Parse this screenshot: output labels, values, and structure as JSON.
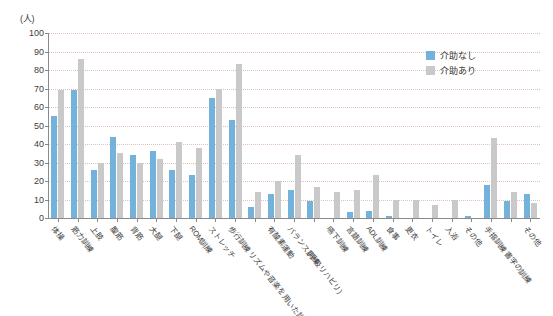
{
  "chart_data": {
    "type": "bar",
    "title": "",
    "subtitle": "",
    "xlabel": "",
    "ylabel": "(人)",
    "ylim": [
      0,
      100
    ],
    "ytick_step": 10,
    "yticks": [
      0,
      10,
      20,
      30,
      40,
      50,
      60,
      70,
      80,
      90,
      100
    ],
    "grid": true,
    "legend_position": "top-right",
    "categories": [
      "体操",
      "筋力訓練",
      "上肢",
      "腹筋",
      "背筋",
      "大腿",
      "下腿",
      "ROM訓練",
      "ストレッチ",
      "歩行訓練",
      "リズムや音楽を用いた訓練",
      "有酸素運動",
      "バランス訓練",
      "(呼吸リハビリ)",
      "嚥下訓練",
      "言語訓練",
      "ADL訓練",
      "食事",
      "更衣",
      "トイレ",
      "入浴",
      "その他",
      "手指訓練",
      "書字の訓練",
      "その他"
    ],
    "category_label_rows": [
      0,
      0,
      0,
      0,
      0,
      0,
      0,
      0,
      0,
      0,
      1,
      0,
      0,
      1,
      0,
      0,
      0,
      0,
      0,
      0,
      0,
      0,
      0,
      1,
      0
    ],
    "series": [
      {
        "name": "介助なし",
        "color": "#73b2da",
        "values": [
          55,
          69,
          26,
          44,
          34,
          36,
          26,
          23,
          65,
          53,
          6,
          13,
          15,
          9,
          0,
          3,
          4,
          1,
          0,
          0,
          0,
          1,
          18,
          9,
          13
        ]
      },
      {
        "name": "介助あり",
        "color": "#c9c9c9",
        "values": [
          69,
          86,
          30,
          35,
          30,
          32,
          41,
          38,
          70,
          83,
          14,
          20,
          34,
          17,
          14,
          15,
          23,
          10,
          10,
          7,
          10,
          0,
          43,
          14,
          8
        ]
      }
    ]
  },
  "legend": {
    "items": [
      {
        "label": "介助なし"
      },
      {
        "label": "介助あり"
      }
    ]
  }
}
